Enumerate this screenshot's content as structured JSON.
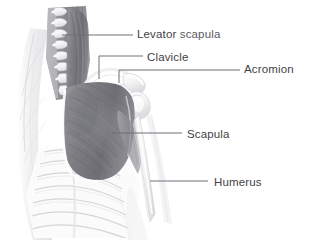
{
  "figure": {
    "width": 314,
    "height": 241,
    "background_color": "#ffffff",
    "illustration_style": "grayscale pencil and wash anatomical drawing",
    "label_text_color": "#4c4c54",
    "leader_line_color": "#6f6f78"
  },
  "labels": [
    {
      "id": "levator-scapula",
      "text": "Levator scapula",
      "lead_word": "Levator",
      "tail_word": " scapula",
      "text_x": 137,
      "text_y": 29,
      "leader": {
        "type": "straight",
        "x1": 62,
        "y1": 35,
        "x2": 133,
        "y2": 35
      }
    },
    {
      "id": "clavicle",
      "text": "Clavicle",
      "lead_word": "Clavicle",
      "tail_word": "",
      "text_x": 147,
      "text_y": 52,
      "leader": {
        "type": "elbow",
        "x1": 99,
        "y1": 79,
        "x2": 99,
        "y2": 56,
        "x3": 143,
        "y3": 56
      }
    },
    {
      "id": "acromion",
      "text": "Acromion",
      "lead_word": "Acromion",
      "tail_word": "",
      "text_x": 244,
      "text_y": 64,
      "leader": {
        "type": "elbow",
        "x1": 119,
        "y1": 83,
        "x2": 119,
        "y2": 70,
        "x3": 240,
        "y3": 70
      }
    },
    {
      "id": "scapula",
      "text": "Scapula",
      "lead_word": "Scapula",
      "tail_word": "",
      "text_x": 187,
      "text_y": 129,
      "leader": {
        "type": "straight",
        "x1": 112,
        "y1": 133,
        "x2": 182,
        "y2": 133
      }
    },
    {
      "id": "humerus",
      "text": "Humerus",
      "lead_word": "Humerus",
      "tail_word": "",
      "text_x": 214,
      "text_y": 177,
      "leader": {
        "type": "straight",
        "x1": 150,
        "y1": 181,
        "x2": 208,
        "y2": 181
      }
    }
  ],
  "anatomy_regions": [
    {
      "id": "cervical-spine",
      "name": "Cervical spine vertebrae",
      "tone": "light-gray"
    },
    {
      "id": "levator-scapula-muscle",
      "name": "Levator scapula muscle",
      "tone": "dark-gray"
    },
    {
      "id": "trapezius-neck",
      "name": "Neck musculature",
      "tone": "mid-gray"
    },
    {
      "id": "clavicle-bone",
      "name": "Clavicle",
      "tone": "white-highlight"
    },
    {
      "id": "acromion-process",
      "name": "Acromion process",
      "tone": "white-highlight"
    },
    {
      "id": "scapular-muscles",
      "name": "Scapular muscle mass",
      "tone": "dark-gray"
    },
    {
      "id": "ribcage",
      "name": "Ribcage",
      "tone": "pale-outline"
    },
    {
      "id": "humerus-bone",
      "name": "Humerus",
      "tone": "pale-gray"
    },
    {
      "id": "arm-contour",
      "name": "Arm and torso contour",
      "tone": "very-light-wash"
    }
  ]
}
